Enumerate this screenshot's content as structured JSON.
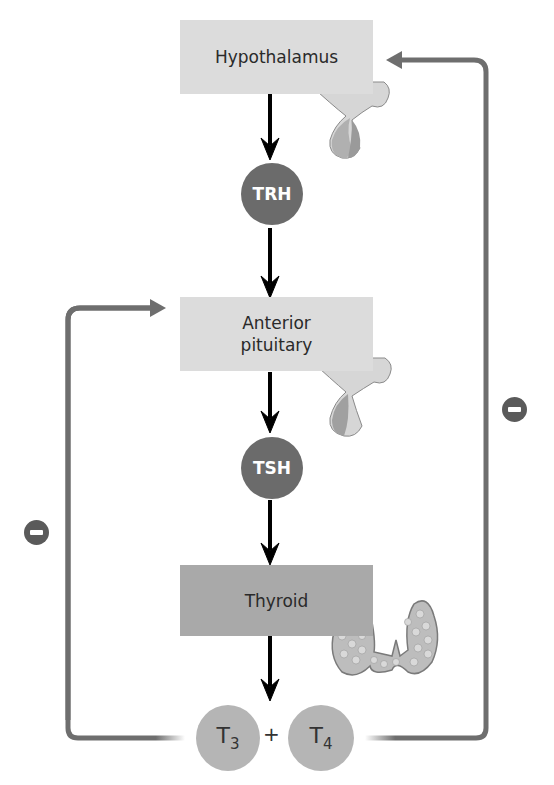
{
  "diagram": {
    "nodes": {
      "hypothalamus": {
        "label": "Hypothalamus"
      },
      "trh": {
        "label": "TRH"
      },
      "anterior_pituitary": {
        "label_line1": "Anterior",
        "label_line2": "pituitary"
      },
      "tsh": {
        "label": "TSH"
      },
      "thyroid": {
        "label": "Thyroid"
      },
      "t3": {
        "base": "T",
        "sub": "3"
      },
      "plus": {
        "label": "+"
      },
      "t4": {
        "base": "T",
        "sub": "4"
      }
    },
    "edges": [
      {
        "from": "Hypothalamus",
        "to": "TRH",
        "type": "stimulatory"
      },
      {
        "from": "TRH",
        "to": "Anterior pituitary",
        "type": "stimulatory"
      },
      {
        "from": "Anterior pituitary",
        "to": "TSH",
        "type": "stimulatory"
      },
      {
        "from": "TSH",
        "to": "Thyroid",
        "type": "stimulatory"
      },
      {
        "from": "Thyroid",
        "to": "T3 + T4",
        "type": "stimulatory"
      },
      {
        "from": "T3 + T4",
        "to": "Anterior pituitary",
        "type": "inhibitory",
        "sign": "−"
      },
      {
        "from": "T3 + T4",
        "to": "Hypothalamus",
        "type": "inhibitory",
        "sign": "−"
      }
    ],
    "colors": {
      "light_box": "#dcdcdc",
      "dark_box": "#a9a9a9",
      "hormone_circle": "#6b6b6b",
      "thyroid_hormone_circle": "#b5b5b5",
      "feedback_line": "#6e6e6e",
      "arrow": "#000000"
    }
  }
}
